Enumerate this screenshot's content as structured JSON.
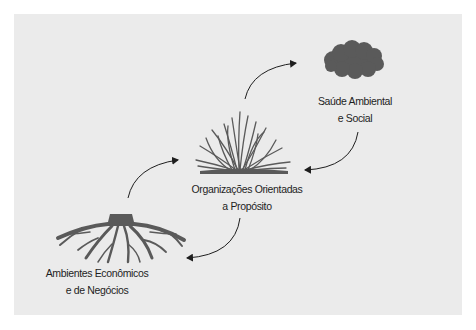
{
  "diagram": {
    "type": "cycle",
    "colors": {
      "background": "#ffffff",
      "panel": "#ebebeb",
      "icon_fill": "#5a5a5a",
      "arrow": "#1e1e1e",
      "text": "#1e1e1e"
    },
    "nodes": [
      {
        "id": "health",
        "icon": "cloud-icon",
        "line1": "Saúde Ambiental",
        "line2": "e Social"
      },
      {
        "id": "organizations",
        "icon": "grass-icon",
        "line1": "Organizações Orientadas",
        "line2": "a Propósito"
      },
      {
        "id": "environments",
        "icon": "roots-icon",
        "line1": "Ambientes Econômicos",
        "line2": "e de Negócios"
      }
    ],
    "edges": [
      {
        "from": "environments",
        "to": "organizations"
      },
      {
        "from": "organizations",
        "to": "health"
      },
      {
        "from": "health",
        "to": "organizations"
      },
      {
        "from": "organizations",
        "to": "environments"
      }
    ]
  }
}
